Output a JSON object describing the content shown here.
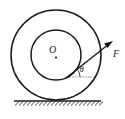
{
  "figure": {
    "background_color": "#ffffff",
    "stroke_color": "#1a1a1a",
    "labels": {
      "center": "O",
      "force": "F",
      "angle": "θ"
    },
    "geometry": {
      "center_x": 56,
      "center_y": 55,
      "outer_radius": 45,
      "inner_radius": 25,
      "ground_y": 100,
      "ground_x_start": 14,
      "ground_x_end": 101,
      "force_start_x": 67,
      "force_start_y": 77,
      "force_tip_x": 112,
      "force_tip_y": 42,
      "ref_line_x_end": 95,
      "angle_degrees": 38
    },
    "elements": {
      "outer_circle": "outer-wheel-circle",
      "inner_circle": "inner-hub-circle",
      "center_point": "center-point-dot",
      "ground": "ground-surface",
      "hatching": "ground-hatching",
      "reference": "horizontal-reference-dashed-line",
      "force_vector": "force-vector-arrow"
    }
  }
}
